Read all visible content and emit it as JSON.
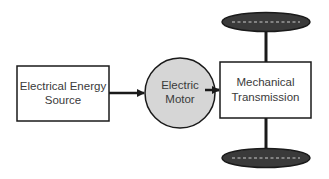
{
  "diagram": {
    "nodes": [
      {
        "id": "source",
        "shape": "rectangle",
        "lines": [
          "Electrical Energy",
          "Source"
        ]
      },
      {
        "id": "motor",
        "shape": "circle",
        "lines": [
          "Electric",
          "Motor"
        ]
      },
      {
        "id": "transmission",
        "shape": "rectangle",
        "lines": [
          "Mechanical",
          "Transmission"
        ]
      }
    ],
    "wheels": [
      {
        "id": "top-wheel",
        "shape": "ellipse"
      },
      {
        "id": "bottom-wheel",
        "shape": "ellipse"
      }
    ],
    "edges": [
      {
        "from": "source",
        "to": "motor",
        "type": "arrow"
      },
      {
        "from": "motor",
        "to": "transmission",
        "type": "arrow"
      },
      {
        "from": "transmission",
        "to": "top-wheel",
        "type": "shaft"
      },
      {
        "from": "transmission",
        "to": "bottom-wheel",
        "type": "shaft"
      }
    ],
    "colors": {
      "stroke": "#1a1a1a",
      "motor_fill": "#d6d6d6",
      "wheel_fill": "#3a3a3a",
      "wheel_dash": "#9a9a9a",
      "text": "#3a3a3a"
    }
  }
}
